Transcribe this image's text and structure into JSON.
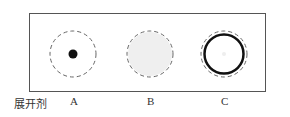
{
  "row_label": "展开剂",
  "samples": [
    {
      "id": "A",
      "label": "A",
      "spot": "small-dark-dot"
    },
    {
      "id": "B",
      "label": "B",
      "spot": "light-gray-disc"
    },
    {
      "id": "C",
      "label": "C",
      "spot": "thick-ring"
    }
  ],
  "colors": {
    "frame": "#555555",
    "dashed": "#666666",
    "dark": "#111111",
    "light_fill": "#ececec"
  }
}
